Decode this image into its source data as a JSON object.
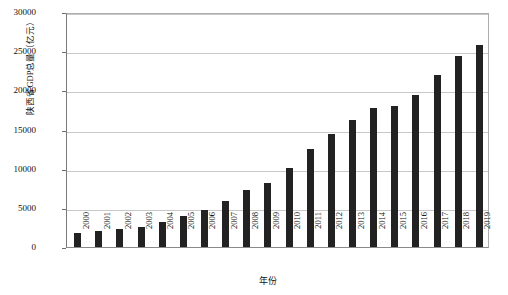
{
  "chart_data": {
    "type": "bar",
    "title": "",
    "xlabel": "年份",
    "ylabel": "陕西省GDP总量（亿元）",
    "ylim": [
      0,
      30000
    ],
    "ytick_labels": [
      "0",
      "5000",
      "10000",
      "15000",
      "20000",
      "25000",
      "30000"
    ],
    "ytick_values": [
      0,
      5000,
      10000,
      15000,
      20000,
      25000,
      30000
    ],
    "grid": true,
    "legend": "none",
    "bar_color": "#222222",
    "categories": [
      "2000",
      "2001",
      "2002",
      "2003",
      "2004",
      "2005",
      "2006",
      "2007",
      "2008",
      "2009",
      "2010",
      "2011",
      "2012",
      "2013",
      "2014",
      "2015",
      "2016",
      "2017",
      "2018",
      "2019"
    ],
    "values": [
      1804,
      2011,
      2254,
      2588,
      3176,
      3934,
      4743,
      5858,
      7315,
      8187,
      10123,
      12513,
      14454,
      16205,
      17690,
      18022,
      19400,
      21899,
      24438,
      25793
    ]
  }
}
